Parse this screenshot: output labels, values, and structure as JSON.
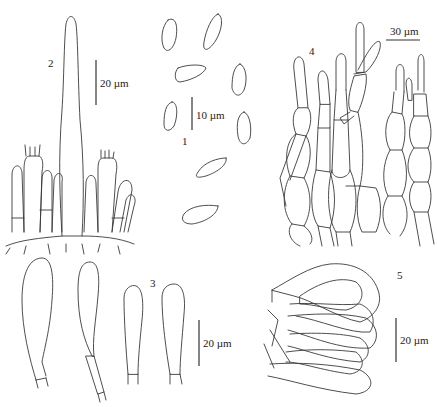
{
  "figure": {
    "panels": [
      {
        "id": "1",
        "label": "1",
        "subject": "spores",
        "scale_label": "10 µm"
      },
      {
        "id": "2",
        "label": "2",
        "subject": "hymenium with cystidium and basidia",
        "scale_label": "20 µm"
      },
      {
        "id": "3",
        "label": "3",
        "subject": "cheilocystidia",
        "scale_label": "20 µm"
      },
      {
        "id": "4",
        "label": "4",
        "subject": "pileipellis hyphae",
        "scale_label": "30 µm"
      },
      {
        "id": "5",
        "label": "5",
        "subject": "clavate cells",
        "scale_label": "20 µm"
      }
    ],
    "colors": {
      "line": "#3a3a3a",
      "background": "#ffffff"
    }
  }
}
